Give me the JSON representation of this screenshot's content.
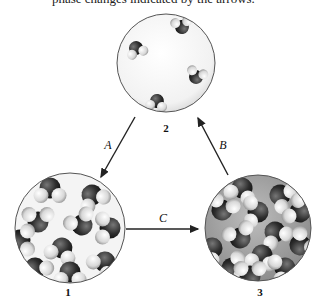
{
  "caption": "phase changes indicated by the arrows.",
  "colors": {
    "oxygen": "#2e2e2e",
    "hydrogen": "#dcdcdc",
    "circle_border": "#555555",
    "arrow": "#222222",
    "background": "#ffffff"
  },
  "states": [
    {
      "id": "1",
      "label": "1",
      "cx": 70,
      "cy": 228,
      "r": 55,
      "description": "ordered, packed molecules (solid lattice)"
    },
    {
      "id": "2",
      "label": "2",
      "cx": 166,
      "cy": 63,
      "r": 49,
      "description": "few widely separated molecules (gas)"
    },
    {
      "id": "3",
      "label": "3",
      "cx": 258,
      "cy": 228,
      "r": 53,
      "description": "densely packed disordered molecules (liquid)"
    }
  ],
  "transitions": [
    {
      "label": "A",
      "from": "2",
      "to": "1"
    },
    {
      "label": "B",
      "from": "3",
      "to": "2"
    },
    {
      "label": "C",
      "from": "1",
      "to": "3"
    }
  ]
}
